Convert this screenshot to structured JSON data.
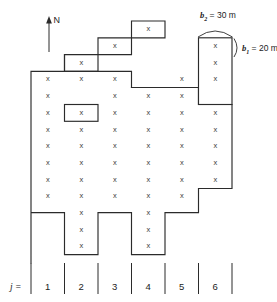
{
  "figure": {
    "north_arrow": {
      "label": "N",
      "direction": "up"
    },
    "axis_label": {
      "text": "j =",
      "description": "column index label"
    },
    "column_numbers": [
      "1",
      "2",
      "3",
      "4",
      "5",
      "6"
    ],
    "annotations": [
      {
        "name": "b2",
        "symbol": "b",
        "subscript": "2",
        "equals": "=",
        "value": "30",
        "unit": "m",
        "text": "b₂ = 30 m",
        "refers_to": "cell-width"
      },
      {
        "name": "b1",
        "symbol": "b",
        "subscript": "1",
        "equals": "=",
        "value": "20",
        "unit": "m",
        "text": "b₁ = 20 m",
        "refers_to": "cell-height"
      }
    ],
    "cell_marker": "x",
    "colors": {
      "line": "#2b2b2b",
      "marker": "#3a3a3a",
      "background": "#ffffff",
      "text": "#1c1c1c"
    },
    "grid": {
      "description": "Irregular finite-difference grid of active cells; columns numbered 1-6 left to right",
      "column_count": 6,
      "x_boundaries": [
        31,
        64.5,
        98,
        131.5,
        165,
        198.5,
        232
      ],
      "row_height": 16.8,
      "marker_rows_y": [
        29,
        45.6,
        62.3,
        79,
        95.7,
        112.4,
        129.1,
        145.8,
        162.5,
        179.2,
        195.9,
        212.6,
        229.3,
        246
      ],
      "columns": [
        {
          "j": "1",
          "marker_rows": [
            3,
            4,
            5,
            6,
            7,
            8,
            9,
            10
          ],
          "blank_cells": []
        },
        {
          "j": "2",
          "marker_rows": [
            2,
            3,
            5,
            6,
            7,
            8,
            9,
            10,
            11,
            12,
            13
          ],
          "blank_cells": [
            4
          ]
        },
        {
          "j": "3",
          "marker_rows": [
            1,
            3,
            4,
            5,
            6,
            7,
            8,
            9,
            10
          ],
          "blank_cells": []
        },
        {
          "j": "4",
          "marker_rows": [
            0,
            4,
            5,
            6,
            7,
            8,
            9,
            10,
            11,
            12,
            13
          ],
          "blank_cells": []
        },
        {
          "j": "5",
          "marker_rows": [
            3,
            4,
            5,
            6,
            7,
            8,
            9,
            10
          ],
          "blank_cells": []
        },
        {
          "j": "6",
          "marker_rows": [
            1,
            2,
            3,
            5,
            6,
            7,
            8,
            9
          ],
          "blank_cells": []
        }
      ]
    }
  }
}
